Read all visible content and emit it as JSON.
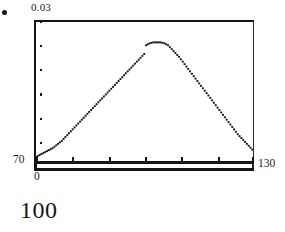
{
  "figure": {
    "marker_icon": "bullet-dot",
    "caption": "100"
  },
  "axes": {
    "y_max_label": "0.03",
    "x_min_label": "70",
    "x_max_label": "130",
    "origin_label": "0"
  },
  "chart_data": {
    "type": "scatter",
    "title": "",
    "subtitle": "",
    "xlabel": "",
    "ylabel": "",
    "legend": [],
    "grid": false,
    "legend_position": "none",
    "xlim": [
      70,
      130
    ],
    "ylim": [
      0,
      0.03
    ],
    "xticks": [
      70,
      80,
      90,
      100,
      110,
      120,
      130
    ],
    "xticklabels": [
      "70",
      "",
      "",
      "",
      "",
      "",
      "130"
    ],
    "yticks": [
      0,
      0.005,
      0.01,
      0.015,
      0.02,
      0.025,
      0.03
    ],
    "yticklabels": [
      "0",
      "",
      "",
      "",
      "",
      "",
      "0.03"
    ],
    "annotations": [
      "0",
      "100"
    ],
    "series": [
      {
        "name": "distribution",
        "marker": "dot",
        "x": [
          70.0,
          70.5,
          71.0,
          71.5,
          72.0,
          72.5,
          73.0,
          73.5,
          74.0,
          74.5,
          75.0,
          75.5,
          76.0,
          76.5,
          77.0,
          77.5,
          78.0,
          78.5,
          79.0,
          79.5,
          80.0,
          80.5,
          81.0,
          81.5,
          82.0,
          82.5,
          83.0,
          83.5,
          84.0,
          84.5,
          85.0,
          85.5,
          86.0,
          86.5,
          87.0,
          87.5,
          88.0,
          88.5,
          89.0,
          89.5,
          90.0,
          90.5,
          91.0,
          91.5,
          92.0,
          92.5,
          93.0,
          93.5,
          94.0,
          94.5,
          95.0,
          95.5,
          96.0,
          96.5,
          97.0,
          97.5,
          98.0,
          98.5,
          99.0,
          99.5,
          100.0,
          100.5,
          101.0,
          101.5,
          102.0,
          102.5,
          103.0,
          103.5,
          104.0,
          104.5,
          105.0,
          105.5,
          106.0,
          106.5,
          107.0,
          107.5,
          108.0,
          108.5,
          109.0,
          109.5,
          110.0,
          110.5,
          111.0,
          111.5,
          112.0,
          112.5,
          113.0,
          113.5,
          114.0,
          114.5,
          115.0,
          115.5,
          116.0,
          116.5,
          117.0,
          117.5,
          118.0,
          118.5,
          119.0,
          119.5,
          120.0,
          120.5,
          121.0,
          121.5,
          122.0,
          122.5,
          123.0,
          123.5,
          124.0,
          124.5,
          125.0,
          125.5,
          126.0,
          126.5,
          127.0,
          127.5,
          128.0,
          128.5,
          129.0,
          129.5,
          130.0
        ],
        "y": [
          0.0021,
          0.0023,
          0.0025,
          0.0027,
          0.0029,
          0.0031,
          0.0033,
          0.0035,
          0.0037,
          0.0039,
          0.0042,
          0.0045,
          0.0048,
          0.0051,
          0.0054,
          0.0058,
          0.0062,
          0.0066,
          0.007,
          0.0074,
          0.0078,
          0.0082,
          0.0086,
          0.009,
          0.0094,
          0.0098,
          0.0102,
          0.0106,
          0.011,
          0.0114,
          0.0118,
          0.0122,
          0.0126,
          0.013,
          0.0134,
          0.0138,
          0.0142,
          0.0146,
          0.015,
          0.0154,
          0.0158,
          0.0162,
          0.0166,
          0.017,
          0.0174,
          0.0178,
          0.0182,
          0.0186,
          0.019,
          0.0194,
          0.0198,
          0.0202,
          0.0206,
          0.021,
          0.0214,
          0.0218,
          0.0222,
          0.0226,
          0.023,
          0.0234,
          0.0252,
          0.0254,
          0.0256,
          0.0257,
          0.0258,
          0.0258,
          0.0258,
          0.0258,
          0.0258,
          0.0257,
          0.0256,
          0.0254,
          0.0252,
          0.0248,
          0.0244,
          0.024,
          0.0236,
          0.0232,
          0.0228,
          0.0223,
          0.0218,
          0.0213,
          0.0208,
          0.0203,
          0.0198,
          0.0193,
          0.0188,
          0.0183,
          0.0178,
          0.0173,
          0.0168,
          0.0163,
          0.0158,
          0.0153,
          0.0148,
          0.0143,
          0.0138,
          0.0133,
          0.0128,
          0.0123,
          0.0118,
          0.0113,
          0.0108,
          0.0103,
          0.0098,
          0.0093,
          0.0088,
          0.0083,
          0.0078,
          0.0073,
          0.0068,
          0.0064,
          0.006,
          0.0056,
          0.0052,
          0.0048,
          0.0044,
          0.004,
          0.0036,
          0.0032,
          0.0028
        ]
      }
    ]
  }
}
